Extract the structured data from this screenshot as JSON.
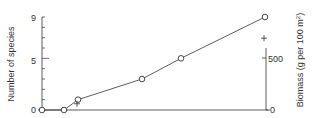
{
  "chart_data": {
    "type": "line",
    "title": "",
    "xlabel": "",
    "ylabel": "Number of species",
    "y2label": "Biomass (g per 100 m²)",
    "ylim": [
      0,
      9
    ],
    "y2lim": [
      0,
      500
    ],
    "yticks": [
      0,
      1,
      2,
      3,
      4,
      5,
      6,
      7,
      8,
      9
    ],
    "ytick_labels": [
      "0",
      "5",
      "9"
    ],
    "y2tick_labels": [
      "0",
      "500"
    ],
    "grid": false,
    "legend": null,
    "series": [
      {
        "name": "Number of species",
        "axis": "left",
        "marker": "open-circle",
        "connected": true,
        "x_px": [
          42,
          64,
          78,
          142,
          181,
          265
        ],
        "values": [
          0,
          0,
          1,
          3,
          5,
          9
        ]
      },
      {
        "name": "Biomass",
        "axis": "right",
        "marker": "plus",
        "connected": false,
        "x_px": [
          77,
          264
        ],
        "values": [
          60,
          690
        ]
      }
    ]
  },
  "labels": {
    "left_axis": "Number of species",
    "right_axis_main": "Biomass (g per 100 m",
    "right_axis_sup": "2",
    "right_axis_end": ")",
    "left_ticks": {
      "zero": "0",
      "five": "5",
      "nine": "9"
    },
    "right_ticks": {
      "zero": "0",
      "five_hundred": "500"
    }
  },
  "colors": {
    "line": "#333333",
    "text": "#333333",
    "background": "#ffffff"
  }
}
